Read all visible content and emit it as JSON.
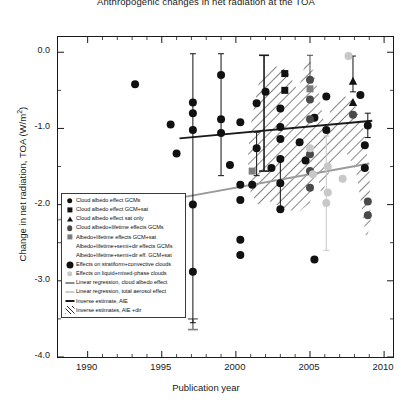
{
  "chart_data": {
    "type": "scatter",
    "title": "Anthropogenic changes in net radiation at the TOA",
    "xlabel": "Publication year",
    "ylabel": "Change in net radiation, TOA (W/m",
    "ylabel_sup": "2",
    "ylabel_close": ")",
    "xlim": [
      1988,
      2010.6
    ],
    "ylim": [
      -4.0,
      0.2
    ],
    "xticks": [
      1990,
      1995,
      2000,
      2005,
      2010
    ],
    "xticklabels": [
      "1990",
      "1995",
      "2000",
      "2005",
      "2010"
    ],
    "xminorticks": [
      1991,
      1992,
      1993,
      1994,
      1996,
      1997,
      1998,
      1999,
      2001,
      2002,
      2003,
      2004,
      2006,
      2007,
      2008,
      2009
    ],
    "yticks": [
      0.0,
      -1.0,
      -2.0,
      -3.0,
      -4.0
    ],
    "yticklabels": [
      "0.0",
      "-1.0",
      "-2.0",
      "-3.0",
      "-4.0"
    ],
    "yminorticks": [
      -0.5,
      -1.5,
      -2.5,
      -3.5
    ],
    "grid": false,
    "legend_position": "lower left",
    "colors": {
      "black": "#111111",
      "dark_gray": "#4a4a4a",
      "mid_gray": "#7d7d7d",
      "light_gray": "#c8c8c8",
      "regression_black": "#1a1a1a",
      "regression_gray": "#9a9a9a",
      "hatch": "#2a2a2a"
    },
    "series": [
      {
        "name": "Cloud albedo effect GCMs",
        "marker": "circle",
        "color": "#111111",
        "points": [
          {
            "x": 1993.2,
            "y": -0.42
          },
          {
            "x": 1995.6,
            "y": -0.95
          },
          {
            "x": 1996.0,
            "y": -1.33
          },
          {
            "x": 1997.1,
            "y": -0.66
          },
          {
            "x": 1997.1,
            "y": -0.8
          },
          {
            "x": 1997.1,
            "y": -1.02,
            "yerr_low": -3.55,
            "yerr_high": -0.02
          },
          {
            "x": 1997.1,
            "y": -2.0
          },
          {
            "x": 1997.1,
            "y": -2.88
          },
          {
            "x": 1999.0,
            "y": -0.3,
            "yerr_low": -1.62,
            "yerr_high": -0.02
          },
          {
            "x": 1999.0,
            "y": -0.88
          },
          {
            "x": 1999.0,
            "y": -1.06
          },
          {
            "x": 1999.6,
            "y": -1.48
          },
          {
            "x": 2000.3,
            "y": -0.92
          },
          {
            "x": 2000.3,
            "y": -1.74
          },
          {
            "x": 2000.3,
            "y": -1.94
          },
          {
            "x": 2000.3,
            "y": -2.46
          },
          {
            "x": 2000.3,
            "y": -2.66
          },
          {
            "x": 2001.4,
            "y": -0.67
          },
          {
            "x": 2001.4,
            "y": -1.26,
            "yerr_low": -1.62,
            "yerr_high": -1.05
          },
          {
            "x": 2002.0,
            "y": -0.52
          },
          {
            "x": 2002.4,
            "y": -1.52
          },
          {
            "x": 2003.0,
            "y": -0.74
          },
          {
            "x": 2003.0,
            "y": -0.98
          },
          {
            "x": 2003.0,
            "y": -1.14
          },
          {
            "x": 2003.0,
            "y": -1.4
          },
          {
            "x": 2003.0,
            "y": -1.72,
            "yerr_low": -2.04,
            "yerr_high": -1.42
          },
          {
            "x": 2003.0,
            "y": -2.06
          },
          {
            "x": 2004.3,
            "y": -1.18
          },
          {
            "x": 2004.7,
            "y": -1.42
          },
          {
            "x": 2005.3,
            "y": -0.86
          },
          {
            "x": 2005.3,
            "y": -2.72
          },
          {
            "x": 2006.1,
            "y": -0.58
          },
          {
            "x": 2006.1,
            "y": -1.02
          },
          {
            "x": 2008.4,
            "y": -0.56
          },
          {
            "x": 2008.9,
            "y": -0.96,
            "yerr_low": -1.12,
            "yerr_high": -0.8
          }
        ]
      },
      {
        "name": "Cloud albedo effect GCM+sat",
        "marker": "square",
        "color": "#111111",
        "points": [
          {
            "x": 2003.3,
            "y": -0.28
          },
          {
            "x": 2003.3,
            "y": -0.5
          }
        ]
      },
      {
        "name": "Cloud albedo effect sat only",
        "marker": "triangle",
        "color": "#111111",
        "points": [
          {
            "x": 2007.9,
            "y": -0.38,
            "yerr_low": -0.52,
            "yerr_high": -0.05
          },
          {
            "x": 2007.9,
            "y": -0.66
          }
        ]
      },
      {
        "name": "Cloud albedo+lifetime effects GCMs",
        "marker": "circle",
        "color": "#4a4a4a",
        "points": [
          {
            "x": 2005.0,
            "y": -0.36,
            "yerr_low": -0.4,
            "yerr_high": -0.04
          },
          {
            "x": 2005.0,
            "y": -0.62
          },
          {
            "x": 2005.0,
            "y": -0.88
          },
          {
            "x": 2005.0,
            "y": -1.34
          },
          {
            "x": 2005.0,
            "y": -1.56
          },
          {
            "x": 2005.0,
            "y": -1.78
          },
          {
            "x": 2007.9,
            "y": -0.82
          },
          {
            "x": 2008.9,
            "y": -1.96
          },
          {
            "x": 2008.9,
            "y": -2.14
          }
        ]
      },
      {
        "name": "Albedo+lifetime effects GCM+sat",
        "marker": "square",
        "color": "#7d7d7d",
        "points": [
          {
            "x": 2005.0,
            "y": -0.48
          },
          {
            "x": 2001.1,
            "y": -1.56
          }
        ]
      },
      {
        "name": "Albedo+lifetime+semi+dir effects GCMs",
        "marker": "none",
        "color": "#7d7d7d",
        "points": []
      },
      {
        "name": "Albedo+lifetime+semi+dir eff. GCM+sat",
        "marker": "none",
        "color": "#7d7d7d",
        "points": []
      },
      {
        "name": "Effects on stratiform+convective clouds",
        "marker": "circle",
        "color": "#111111",
        "points": [
          {
            "x": 2001.1,
            "y": -1.74
          },
          {
            "x": 2008.7,
            "y": -1.22
          },
          {
            "x": 2008.7,
            "y": -1.52
          }
        ]
      },
      {
        "name": "Effects on liquid+mixed-phase clouds",
        "marker": "circle",
        "color": "#c8c8c8",
        "points": [
          {
            "x": 2007.6,
            "y": -0.05
          },
          {
            "x": 2006.2,
            "y": -1.5
          },
          {
            "x": 2006.2,
            "y": -1.84
          },
          {
            "x": 2005.2,
            "y": -1.6
          },
          {
            "x": 2007.2,
            "y": -1.66
          },
          {
            "x": 2005.0,
            "y": -1.26
          },
          {
            "x": 2006.1,
            "y": -1.98,
            "yerr_low": -2.6,
            "yerr_high": -1.1
          }
        ]
      }
    ],
    "lines": [
      {
        "name": "Linear regression, cloud albedo effect",
        "color": "#1a1a1a",
        "style": "solid",
        "x1": 1996.2,
        "y1": -1.13,
        "x2": 2009.2,
        "y2": -0.9
      },
      {
        "name": "Linear regression, total aerosol effect",
        "color": "#9a9a9a",
        "style": "solid",
        "x1": 1988.0,
        "y1": -2.2,
        "x2": 2009.0,
        "y2": -1.46
      }
    ],
    "uncertainty_bars": [
      {
        "name": "Inverse estimate, AIE",
        "x": 2001.9,
        "y_top": -0.04,
        "y_bottom": -1.56,
        "color": "#1a1a1a"
      },
      {
        "name": "Inverse estimate, AIE lower",
        "x": 1997.1,
        "y_top": -3.5,
        "y_bottom": -3.64,
        "color": "#7d7d7d"
      }
    ],
    "hatched_region": {
      "name": "Inverse estimates, AIE +dir",
      "color": "#2a2a2a",
      "description": "Hatched polygon spanning ~2001-2009 between about -0.2 and -2.4 W/m2 with a notch near 2006"
    },
    "legend": [
      {
        "label": "Cloud albedo effect GCMs",
        "symbol": "circle",
        "color": "#111111"
      },
      {
        "label": "Cloud albedo effect GCM+sat",
        "symbol": "square",
        "color": "#111111"
      },
      {
        "label": "Cloud albedo effect sat only",
        "symbol": "triangle",
        "color": "#111111"
      },
      {
        "label": "Cloud albedo+lifetime effects GCMs",
        "symbol": "circle",
        "color": "#4a4a4a"
      },
      {
        "label": "Albedo+lifetime effects GCM+sat",
        "symbol": "square",
        "color": "#7d7d7d"
      },
      {
        "label": "Albedo+lifetime+semi+dir effects GCMs",
        "symbol": "none",
        "color": "#7d7d7d"
      },
      {
        "label": "Albedo+lifetime+semi+dir eff. GCM+sat",
        "symbol": "none",
        "color": "#7d7d7d"
      },
      {
        "label": "Effects on stratiform+convective clouds",
        "symbol": "circle-large",
        "color": "#111111"
      },
      {
        "label": "Effects on liquid+mixed-phase clouds",
        "symbol": "circle",
        "color": "#c8c8c8"
      },
      {
        "label": "Linear regression, cloud albedo effect",
        "symbol": "line",
        "color": "#1a1a1a"
      },
      {
        "label": "Linear regression, total aerosol effect",
        "symbol": "line",
        "color": "#9a9a9a"
      },
      {
        "label": "Inverse estimate, AIE",
        "symbol": "line-thick",
        "color": "#1a1a1a"
      },
      {
        "label": "Inverse estimates, AIE +dir",
        "symbol": "hatch",
        "color": "#2a2a2a"
      }
    ]
  }
}
